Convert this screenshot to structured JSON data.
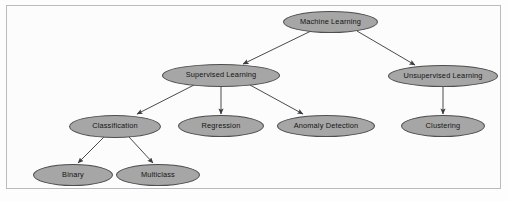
{
  "diagram": {
    "type": "tree",
    "colors": {
      "node_fill": "#a6a6a6",
      "node_stroke": "#4e4e4e",
      "edge": "#4a4a4a",
      "frame": "#b9bcbe",
      "background": "#fcfcfc",
      "label_text": "#141414"
    },
    "nodes": [
      {
        "id": "machine-learning",
        "label": "Machine Learning",
        "cx": 330.5,
        "cy": 22,
        "rx": 47.5,
        "ry": 11
      },
      {
        "id": "supervised-learning",
        "label": "Supervised Learning",
        "cx": 221,
        "cy": 75,
        "rx": 59,
        "ry": 11.5
      },
      {
        "id": "unsupervised-learning",
        "label": "Unsupervised Learning",
        "cx": 443,
        "cy": 76,
        "rx": 55,
        "ry": 11
      },
      {
        "id": "classification",
        "label": "Classification",
        "cx": 115,
        "cy": 126,
        "rx": 46,
        "ry": 11.5
      },
      {
        "id": "regression",
        "label": "Regression",
        "cx": 221,
        "cy": 126,
        "rx": 43,
        "ry": 11
      },
      {
        "id": "anomaly-detection",
        "label": "Anomaly Detection",
        "cx": 326,
        "cy": 126,
        "rx": 49,
        "ry": 11
      },
      {
        "id": "clustering",
        "label": "Clustering",
        "cx": 443,
        "cy": 126,
        "rx": 42,
        "ry": 11
      },
      {
        "id": "binary",
        "label": "Binary",
        "cx": 73,
        "cy": 175,
        "rx": 40,
        "ry": 11
      },
      {
        "id": "multiclass",
        "label": "Multiclass",
        "cx": 158,
        "cy": 175,
        "rx": 42,
        "ry": 11
      }
    ],
    "edges": [
      {
        "id": "edge-ml-supervised",
        "from": "machine-learning",
        "to": "supervised-learning",
        "x1": 311,
        "y1": 31,
        "x2": 243,
        "y2": 64
      },
      {
        "id": "edge-ml-unsupervised",
        "from": "machine-learning",
        "to": "unsupervised-learning",
        "x1": 357,
        "y1": 31,
        "x2": 415,
        "y2": 65
      },
      {
        "id": "edge-supervised-classification",
        "from": "supervised-learning",
        "to": "classification",
        "x1": 194,
        "y1": 85,
        "x2": 137,
        "y2": 114
      },
      {
        "id": "edge-supervised-regression",
        "from": "supervised-learning",
        "to": "regression",
        "x1": 221,
        "y1": 87,
        "x2": 221,
        "y2": 114
      },
      {
        "id": "edge-supervised-anomaly",
        "from": "supervised-learning",
        "to": "anomaly-detection",
        "x1": 250,
        "y1": 85,
        "x2": 303,
        "y2": 114
      },
      {
        "id": "edge-unsupervised-clustering",
        "from": "unsupervised-learning",
        "to": "clustering",
        "x1": 443,
        "y1": 87,
        "x2": 443,
        "y2": 114
      },
      {
        "id": "edge-classification-binary",
        "from": "classification",
        "to": "binary",
        "x1": 104,
        "y1": 137,
        "x2": 78,
        "y2": 163
      },
      {
        "id": "edge-classification-multiclass",
        "from": "classification",
        "to": "multiclass",
        "x1": 129,
        "y1": 137,
        "x2": 153,
        "y2": 163
      }
    ]
  }
}
